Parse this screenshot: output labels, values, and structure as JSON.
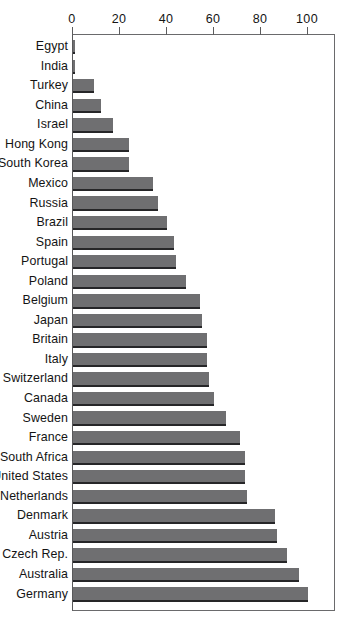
{
  "chart_data": {
    "type": "bar",
    "orientation": "horizontal",
    "title": "",
    "subtitle": "",
    "xlabel": "",
    "ylabel": "",
    "xlim": [
      0,
      112
    ],
    "xticks": [
      0,
      20,
      40,
      60,
      80,
      100
    ],
    "xtick_labels": [
      "0",
      "20",
      "40",
      "60",
      "80",
      "100"
    ],
    "grid": false,
    "legend": "none",
    "bar_color": "#6f6f71",
    "bar_edge_color": "#262628",
    "axis_color": "#6a6a6c",
    "categories": [
      "Egypt",
      "India",
      "Turkey",
      "China",
      "Israel",
      "Hong Kong",
      "South Korea",
      "Mexico",
      "Russia",
      "Brazil",
      "Spain",
      "Portugal",
      "Poland",
      "Belgium",
      "Japan",
      "Britain",
      "Italy",
      "Switzerland",
      "Canada",
      "Sweden",
      "France",
      "South Africa",
      "United States",
      "Netherlands",
      "Denmark",
      "Austria",
      "Czech Rep.",
      "Australia",
      "Germany"
    ],
    "values": [
      1,
      1,
      9,
      12,
      17,
      24,
      24,
      34,
      36,
      40,
      43,
      44,
      48,
      54,
      55,
      57,
      57,
      58,
      60,
      65,
      71,
      73,
      73,
      74,
      86,
      87,
      91,
      96,
      100
    ]
  }
}
